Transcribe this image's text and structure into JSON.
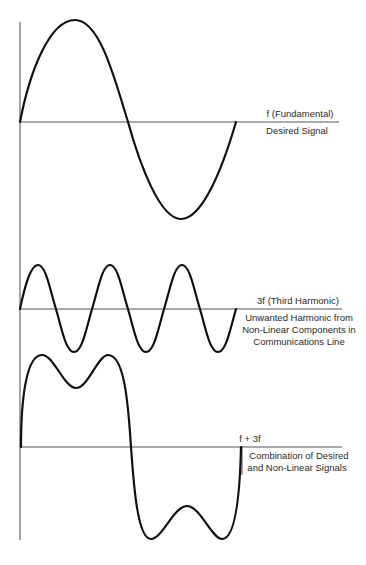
{
  "diagram": {
    "signals": [
      {
        "id": "fundamental",
        "title": "f (Fundamental)",
        "description": [
          "Desired Signal"
        ]
      },
      {
        "id": "third-harmonic",
        "title": "3f (Third Harmonic)",
        "description": [
          "Unwanted Harmonic from",
          "Non-Linear Components in",
          "Communications Line"
        ]
      },
      {
        "id": "combination",
        "title": "f + 3f",
        "description": [
          "Combination of Desired",
          "and Non-Linear Signals"
        ]
      }
    ],
    "colors": {
      "wave": "#111111",
      "axis": "#6a6a6a",
      "text": "#2a2a2a",
      "background": "#ffffff"
    }
  }
}
